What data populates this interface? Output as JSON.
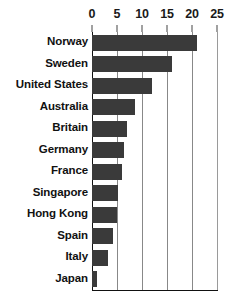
{
  "chart_data": {
    "type": "bar",
    "orientation": "horizontal",
    "title": "",
    "subtitle": "",
    "xlabel": "",
    "ylabel": "",
    "categories": [
      "Norway",
      "Sweden",
      "United States",
      "Australia",
      "Britain",
      "Germany",
      "France",
      "Singapore",
      "Hong Kong",
      "Spain",
      "Italy",
      "Japan"
    ],
    "values": [
      21,
      16,
      12,
      8.6,
      7,
      6.4,
      6,
      5.2,
      5,
      4.2,
      3.2,
      1
    ],
    "xlim": [
      0,
      25
    ],
    "xticks": [
      0,
      5,
      10,
      15,
      20,
      25
    ],
    "xtick_labels": [
      "0",
      "5",
      "10",
      "15",
      "20",
      "25"
    ],
    "grid": true,
    "grid_axis": "x",
    "legend": false,
    "legend_position": "none",
    "annotations": [],
    "colors": {
      "bar": "#3a3a3a",
      "gridline": "#888888",
      "axis": "#111111",
      "text": "#111111",
      "background": "#ffffff"
    }
  }
}
